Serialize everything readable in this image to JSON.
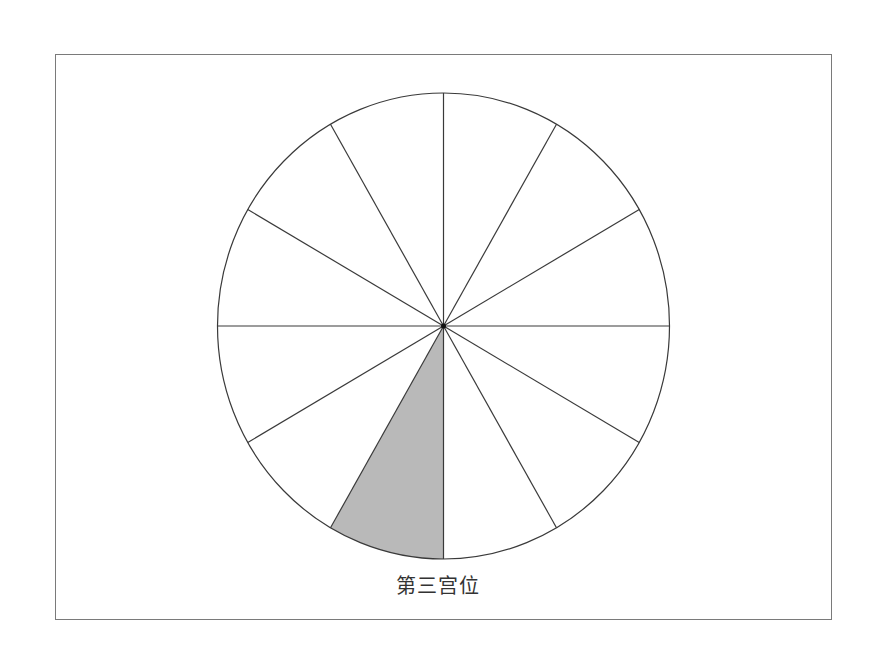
{
  "diagram": {
    "type": "house-wheel",
    "segments": 12,
    "highlighted_segment": 3,
    "highlight_color": "#b9b9b9",
    "line_color": "#3a3a3a",
    "frame_color": "#7a7a7a",
    "caption": "第三宫位"
  }
}
